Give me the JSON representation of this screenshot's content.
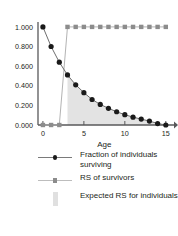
{
  "chart_data": {
    "type": "line",
    "title": "",
    "xlabel": "Age",
    "ylabel": "",
    "xlim": [
      -0.6,
      16.0
    ],
    "ylim": [
      0.0,
      1.05
    ],
    "xticks": [
      0,
      5,
      10,
      15
    ],
    "xtick_labels": [
      "0",
      "5",
      "10",
      "15"
    ],
    "yticks": [
      0.0,
      0.2,
      0.4,
      0.6,
      0.8,
      1.0
    ],
    "ytick_labels": [
      "0.000",
      "0.200",
      "0.400",
      "0.600",
      "0.800",
      "1.000"
    ],
    "grid": false,
    "legend_position": "below",
    "series": [
      {
        "name": "Fraction of individuals surviving",
        "marker": "circle",
        "color": "#1a1a1a",
        "line_color": "#6e6e6e",
        "x": [
          0,
          1,
          2,
          3,
          4,
          5,
          6,
          7,
          8,
          9,
          10,
          11,
          12,
          13,
          14,
          15
        ],
        "values": [
          1.0,
          0.8,
          0.64,
          0.51,
          0.41,
          0.33,
          0.26,
          0.21,
          0.17,
          0.135,
          0.105,
          0.08,
          0.06,
          0.04,
          0.015,
          0.0
        ]
      },
      {
        "name": "RS of survivors",
        "marker": "square",
        "color": "#8c8c8c",
        "line_color": "#b3b3b3",
        "x": [
          0,
          1,
          2,
          3,
          4,
          5,
          6,
          7,
          8,
          9,
          10,
          11,
          12,
          13,
          14,
          15
        ],
        "values": [
          0.0,
          0.0,
          0.0,
          1.0,
          1.0,
          1.0,
          1.0,
          1.0,
          1.0,
          1.0,
          1.0,
          1.0,
          1.0,
          1.0,
          1.0,
          1.0
        ]
      },
      {
        "name": "Expected RS for individuals",
        "marker": "area",
        "color": "#e3e3e3",
        "x": [
          3,
          4,
          5,
          6,
          7,
          8,
          9,
          10,
          11,
          12,
          13,
          14,
          15
        ],
        "values": [
          0.51,
          0.41,
          0.33,
          0.26,
          0.21,
          0.17,
          0.135,
          0.105,
          0.08,
          0.06,
          0.04,
          0.015,
          0.0
        ]
      }
    ]
  },
  "axis": {
    "x_title": "Age",
    "x_tick_labels": [
      "0",
      "5",
      "10",
      "15"
    ],
    "y_tick_labels": [
      "1.000",
      "0.800",
      "0.600",
      "0.400",
      "0.200",
      "0.000"
    ]
  },
  "legend": {
    "items": [
      {
        "label": "Fraction of individuals surviving",
        "marker": "circle-with-line",
        "marker_color": "#1a1a1a",
        "line_color": "#7a7a7a"
      },
      {
        "label": "RS of survivors",
        "marker": "square-with-line",
        "marker_color": "#8c8c8c",
        "line_color": "#bdbdbd"
      },
      {
        "label": "Expected RS for individuals",
        "marker": "area-swatch",
        "marker_color": "#e0e0e0",
        "line_color": "#e0e0e0"
      }
    ]
  },
  "colors": {
    "axis": "#58585a",
    "text": "#231f20",
    "survival_marker": "#1a1a1a",
    "rs_marker": "#8c8c8c",
    "expected_fill": "#e3e3e3",
    "background": "#ffffff"
  }
}
